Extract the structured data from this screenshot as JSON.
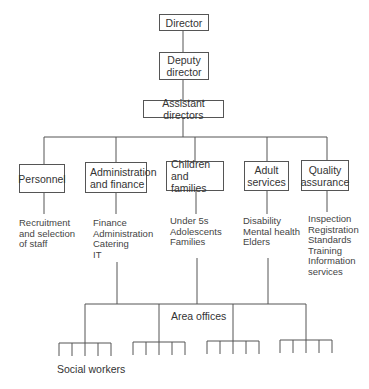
{
  "diagram": {
    "type": "org-chart",
    "top": [
      {
        "id": "director",
        "label": "Director"
      },
      {
        "id": "deputy",
        "label": "Deputy director"
      },
      {
        "id": "assistant",
        "label": "Assistant directors"
      }
    ],
    "departments": [
      {
        "id": "personnel",
        "title": [
          "Personnel"
        ],
        "items": [
          "Recruitment",
          "and selection",
          "of staff"
        ]
      },
      {
        "id": "admin",
        "title": [
          "Administration",
          "and finance"
        ],
        "items": [
          "Finance",
          "Administration",
          "Catering",
          "IT"
        ]
      },
      {
        "id": "children",
        "title": [
          "Children and",
          "families"
        ],
        "items": [
          "Under 5s",
          "Adolescents",
          "Families"
        ]
      },
      {
        "id": "adult",
        "title": [
          "Adult",
          "services"
        ],
        "items": [
          "Disability",
          "Mental health",
          "Elders"
        ]
      },
      {
        "id": "quality",
        "title": [
          "Quality",
          "assurance"
        ],
        "items": [
          "Inspection",
          "Registration",
          "Standards",
          "Training",
          "Information",
          "services"
        ]
      }
    ],
    "area_offices_label": "Area offices",
    "social_workers_label": "Social workers",
    "area_office_groups": 4,
    "workers_per_group": 5
  }
}
